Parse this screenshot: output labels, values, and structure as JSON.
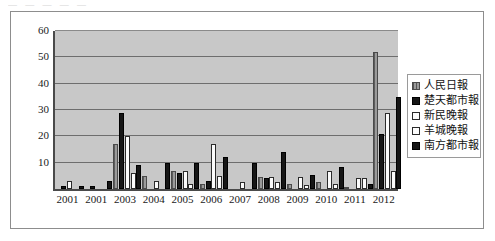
{
  "top_fragment": "— — —   — —",
  "chart_data": {
    "type": "bar",
    "title": "",
    "xlabel": "",
    "ylabel": "",
    "ylim": [
      0,
      60
    ],
    "yticks": [
      0,
      10,
      20,
      30,
      40,
      50,
      60
    ],
    "grid": true,
    "legend_position": "right",
    "categories": [
      "2001",
      "2001",
      "2003",
      "2004",
      "2005",
      "2006",
      "2007",
      "2008",
      "2009",
      "2010",
      "2011",
      "2012"
    ],
    "series": [
      {
        "name": "人民日報",
        "swatch": "gray-hatched",
        "color": "#9a9a9a",
        "values": [
          0,
          0,
          17,
          5,
          7,
          2,
          0,
          4.5,
          2,
          2.5,
          0.5,
          52
        ]
      },
      {
        "name": "楚天都市報",
        "swatch": "black",
        "color": "#161616",
        "values": [
          1,
          1,
          29,
          0,
          6,
          3,
          0,
          4,
          0,
          0,
          0,
          21
        ]
      },
      {
        "name": "新民晚報",
        "swatch": "white",
        "color": "#fbfbfb",
        "values": [
          3,
          0,
          20,
          3,
          7,
          17,
          2.5,
          4.5,
          4.5,
          7,
          4,
          29
        ]
      },
      {
        "name": "羊城晚報",
        "swatch": "white",
        "color": "#fbfbfb",
        "values": [
          0,
          0,
          6,
          0,
          2,
          5,
          0,
          2.5,
          1.5,
          2,
          4,
          7
        ]
      },
      {
        "name": "南方都市報",
        "swatch": "black",
        "color": "#161616",
        "values": [
          1,
          3,
          9,
          10,
          10,
          12,
          10,
          14,
          5.5,
          8.5,
          2,
          35
        ]
      }
    ]
  },
  "legend": {
    "items": [
      {
        "label": "人民日報"
      },
      {
        "label": "楚天都市報"
      },
      {
        "label": "新民晚報"
      },
      {
        "label": "羊城晚報"
      },
      {
        "label": "南方都市報"
      }
    ]
  }
}
